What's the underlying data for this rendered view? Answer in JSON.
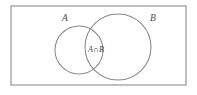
{
  "figure": {
    "type": "venn-diagram",
    "background_color": "#ffffff",
    "line_color": "#8a8a8a",
    "text_color": "#4a4a4a"
  },
  "universe": {
    "name": "universal-set-rectangle",
    "x": 11,
    "y": 6,
    "width": 175,
    "height": 79
  },
  "sets": [
    {
      "id": "A",
      "label": "A",
      "label_x": 65,
      "label_y": 21,
      "cx": 79,
      "cy": 50,
      "r": 24
    },
    {
      "id": "B",
      "label": "B",
      "label_x": 153,
      "label_y": 21,
      "cx": 118,
      "cy": 47,
      "r": 33
    }
  ],
  "intersection": {
    "label": "A∩B",
    "label_x": 96,
    "label_y": 52
  }
}
